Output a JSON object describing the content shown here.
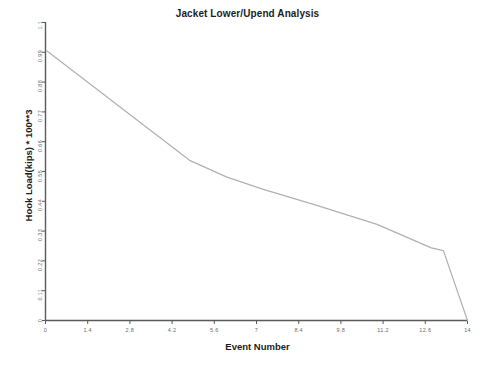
{
  "chart_data": {
    "type": "line",
    "title": "Jacket Lower/Upend Analysis",
    "xlabel": "Event Number",
    "ylabel": "Hook Load(kips) * 100**3",
    "xlim": [
      0,
      14
    ],
    "ylim": [
      0,
      1.1
    ],
    "grid": false,
    "legend": null,
    "line_color": "#b0b0b0",
    "axis_color": "#5a5a5a",
    "xticks": [
      "0",
      "1.4",
      "2.8",
      "4.2",
      "5.6",
      "7",
      "8.4",
      "9.8",
      "11.2",
      "12.6",
      "14"
    ],
    "xtick_values": [
      0,
      1.4,
      2.8,
      4.2,
      5.6,
      7,
      8.4,
      9.8,
      11.2,
      12.6,
      14
    ],
    "yticks": [
      "0",
      "0.11",
      "0.22",
      "0.33",
      "0.44",
      "0.55",
      "0.66",
      "0.77",
      "0.88",
      "0.99",
      "1.1"
    ],
    "ytick_values": [
      0,
      0.11,
      0.22,
      0.33,
      0.44,
      0.55,
      0.66,
      0.77,
      0.88,
      0.99,
      1.1
    ],
    "series": [
      {
        "name": "Hook Load",
        "x": [
          0.05,
          4.8,
          6.0,
          7.2,
          9.0,
          11.0,
          12.8,
          13.2,
          14.0
        ],
        "y": [
          0.995,
          0.59,
          0.53,
          0.485,
          0.425,
          0.355,
          0.268,
          0.258,
          0.0
        ]
      }
    ]
  }
}
